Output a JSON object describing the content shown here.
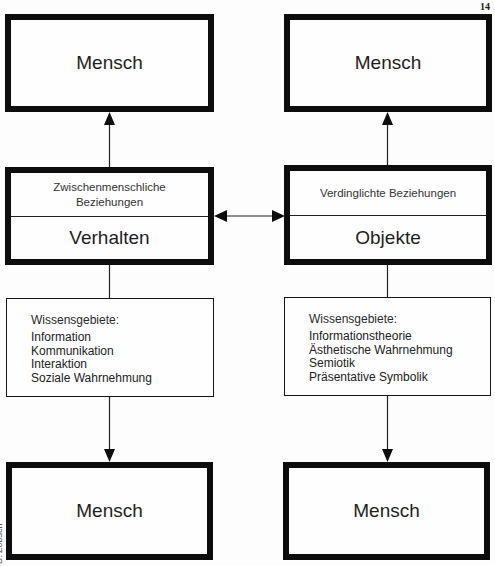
{
  "page_number": "14",
  "credit": "B. Zobsch",
  "top_row": {
    "left": {
      "label": "Mensch"
    },
    "right": {
      "label": "Mensch"
    }
  },
  "middle_row": {
    "left": {
      "subtitle": "Zwischenmenschliche Beziehungen",
      "title": "Verhalten"
    },
    "right": {
      "subtitle": "Verdinglichte Beziehungen",
      "title": "Objekte"
    }
  },
  "knowledge_row": {
    "left": {
      "heading": "Wissensgebiete:",
      "items": [
        "Information",
        "Kommunikation",
        "Interaktion",
        "Soziale Wahrnehmung"
      ]
    },
    "right": {
      "heading": "Wissensgebiete:",
      "items": [
        "Informationstheorie",
        "Ästhetische Wahrnehmung",
        "Semiotik",
        "Präsentative Symbolik"
      ]
    }
  },
  "bottom_row": {
    "left": {
      "label": "Mensch"
    },
    "right": {
      "label": "Mensch"
    }
  },
  "colors": {
    "ink": "#0d0d0d",
    "paper": "#fdfdfd"
  }
}
